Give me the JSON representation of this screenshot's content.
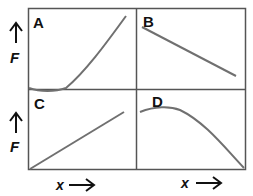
{
  "panels": [
    {
      "id": "A",
      "label": "A",
      "shape": "curve dips slightly below zero then rises steeply"
    },
    {
      "id": "B",
      "label": "B",
      "shape": "linear decrease"
    },
    {
      "id": "C",
      "label": "C",
      "shape": "linear increase from origin"
    },
    {
      "id": "D",
      "label": "D",
      "shape": "rises slightly to max then falls to zero"
    }
  ],
  "axes": {
    "y_label": "F",
    "x_label": "x",
    "y_arrow": "↑",
    "x_arrow": "→"
  },
  "colors": {
    "frame": "#555555",
    "curve": "#707070",
    "text": "#111111"
  }
}
